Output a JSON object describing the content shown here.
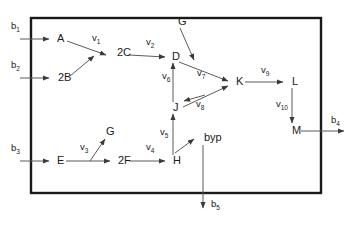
{
  "diagram": {
    "boundary": {
      "name": "system-boundary",
      "x": 31,
      "y": 18,
      "width": 290,
      "height": 175,
      "color": "#1a1a1a"
    },
    "edge_color": "#5b5b5b",
    "nodes": [
      {
        "id": "A",
        "label": "A",
        "x": 57,
        "y": 39
      },
      {
        "id": "2B",
        "label": "2B",
        "x": 58,
        "y": 78
      },
      {
        "id": "2C",
        "label": "2C",
        "x": 117,
        "y": 53
      },
      {
        "id": "D",
        "label": "D",
        "x": 172,
        "y": 57
      },
      {
        "id": "G1",
        "label": "G",
        "x": 178,
        "y": 22
      },
      {
        "id": "K",
        "label": "K",
        "x": 236,
        "y": 82
      },
      {
        "id": "L",
        "label": "L",
        "x": 292,
        "y": 82
      },
      {
        "id": "M",
        "label": "M",
        "x": 292,
        "y": 131
      },
      {
        "id": "J",
        "label": "J",
        "x": 173,
        "y": 108
      },
      {
        "id": "byp",
        "label": "byp",
        "x": 204,
        "y": 138
      },
      {
        "id": "H",
        "label": "H",
        "x": 173,
        "y": 161
      },
      {
        "id": "E",
        "label": "E",
        "x": 57,
        "y": 161
      },
      {
        "id": "2F",
        "label": "2F",
        "x": 118,
        "y": 161
      },
      {
        "id": "G2",
        "label": "G",
        "x": 106,
        "y": 132
      }
    ],
    "flux_labels": [
      {
        "id": "v1",
        "base": "v",
        "sub": "1",
        "x": 92,
        "y": 41
      },
      {
        "id": "v2",
        "base": "v",
        "sub": "2",
        "x": 146,
        "y": 45
      },
      {
        "id": "v3",
        "base": "v",
        "sub": "3",
        "x": 80,
        "y": 150
      },
      {
        "id": "v4",
        "base": "v",
        "sub": "4",
        "x": 146,
        "y": 150
      },
      {
        "id": "v5",
        "base": "v",
        "sub": "5",
        "x": 160,
        "y": 135
      },
      {
        "id": "v6",
        "base": "v",
        "sub": "6",
        "x": 162,
        "y": 79
      },
      {
        "id": "v7",
        "base": "v",
        "sub": "7",
        "x": 197,
        "y": 76
      },
      {
        "id": "v8",
        "base": "v",
        "sub": "8",
        "x": 196,
        "y": 107
      },
      {
        "id": "v9",
        "base": "v",
        "sub": "9",
        "x": 261,
        "y": 73
      },
      {
        "id": "v10",
        "base": "v",
        "sub": "10",
        "x": 276,
        "y": 107
      }
    ],
    "boundary_fluxes": [
      {
        "id": "b1",
        "base": "b",
        "sub": "1",
        "x": 11,
        "y": 29
      },
      {
        "id": "b2",
        "base": "b",
        "sub": "2",
        "x": 11,
        "y": 68
      },
      {
        "id": "b3",
        "base": "b",
        "sub": "3",
        "x": 11,
        "y": 151
      },
      {
        "id": "b4",
        "base": "b",
        "sub": "4",
        "x": 331,
        "y": 123
      },
      {
        "id": "b5",
        "base": "b",
        "sub": "5",
        "x": 211,
        "y": 207
      }
    ],
    "edges": [
      {
        "id": "b1-to-A",
        "from": "b1",
        "to": "A",
        "path": "M 20 39 L 49 39",
        "arrow": true
      },
      {
        "id": "b2-to-2B",
        "from": "b2",
        "to": "2B",
        "path": "M 20 78 L 49 78",
        "arrow": true
      },
      {
        "id": "b3-to-E",
        "from": "b3",
        "to": "E",
        "path": "M 20 161 L 49 161",
        "arrow": true
      },
      {
        "id": "A-to-merge",
        "from": "A",
        "to": "2C",
        "path": "M 67 41 L 106 55",
        "arrow": true
      },
      {
        "id": "2B-to-merge",
        "from": "2B",
        "to": "2C",
        "path": "M 70 76 L 94 56",
        "arrow": true
      },
      {
        "id": "2C-to-D",
        "from": "2C",
        "to": "D",
        "path": "M 129 55 L 165 57",
        "arrow": true
      },
      {
        "id": "G1-to-v7",
        "from": "G1",
        "to": "K",
        "path": "M 180 28 L 194 60",
        "arrow": true
      },
      {
        "id": "D-to-K",
        "from": "D",
        "to": "K",
        "path": "M 179 62 L 228 81",
        "arrow": true
      },
      {
        "id": "J-to-K",
        "from": "J",
        "to": "K",
        "path": "M 183 107 L 228 86",
        "arrow": true
      },
      {
        "id": "K-to-J",
        "from": "K",
        "to": "J",
        "path": "M 205 95 L 184 101",
        "arrow": true
      },
      {
        "id": "K-to-L",
        "from": "K",
        "to": "L",
        "path": "M 245 82 L 283 82",
        "arrow": true
      },
      {
        "id": "L-to-M",
        "from": "L",
        "to": "M",
        "path": "M 292 88 L 292 123",
        "arrow": true
      },
      {
        "id": "M-to-b4",
        "from": "M",
        "to": "b4",
        "path": "M 301 131 L 344 131",
        "arrow": true
      },
      {
        "id": "H-to-J",
        "from": "H",
        "to": "J",
        "path": "M 173 155 L 173 114",
        "arrow": true
      },
      {
        "id": "J-to-D",
        "from": "J",
        "to": "D",
        "path": "M 173 102 L 173 63",
        "arrow": true
      },
      {
        "id": "H-to-byp",
        "from": "H",
        "to": "byp",
        "path": "M 175 153 L 194 139",
        "arrow": true
      },
      {
        "id": "byp-to-b5",
        "from": "byp",
        "to": "b5",
        "path": "M 203 145 L 203 208",
        "arrow": true
      },
      {
        "id": "E-to-2F",
        "from": "E",
        "to": "2F",
        "path": "M 66 161 L 110 161",
        "arrow": true
      },
      {
        "id": "E-to-G2",
        "from": "E",
        "to": "G2",
        "path": "M 90 161 L 105 139",
        "arrow": true
      },
      {
        "id": "2F-to-H",
        "from": "2F",
        "to": "H",
        "path": "M 129 161 L 165 161",
        "arrow": true
      }
    ]
  }
}
